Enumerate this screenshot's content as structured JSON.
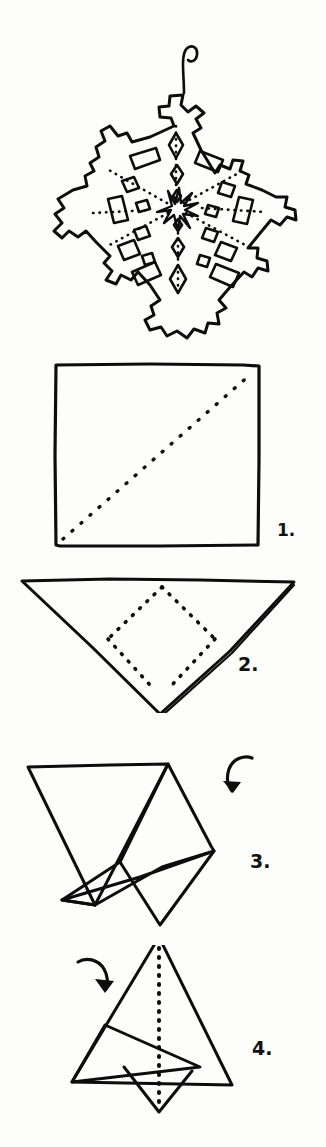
{
  "document": {
    "title": "Paper Snowflake Folding Instructions",
    "type": "hand-drawn instructional diagram",
    "background_color": "#fdfdfc",
    "ink_color": "#0d0d0d"
  },
  "result_figure": {
    "name": "finished-snowflake",
    "description": "Six-pointed hand-cut paper snowflake with hanging loop at top, cross-shaped arm tips, and cut-out diamond and rectangle holes; dotted radial fold lines converge on a small six-pointed star at the center.",
    "points": 6,
    "has_hanging_loop": true,
    "center_motif": "six-pointed star"
  },
  "steps": [
    {
      "number": "1.",
      "name": "fold-square-diagonally",
      "shape": "square",
      "fold_line": "diagonal dotted line from bottom-left corner to top-right corner"
    },
    {
      "number": "2.",
      "name": "fold-triangle-thirds",
      "shape": "downward triangle",
      "fold_line": "two dotted lines forming a V from the top edge to the bottom point"
    },
    {
      "number": "3.",
      "name": "fold-left-flap-over",
      "shape": "overlapping folded triangles",
      "arrow": "curved arrow pointing down-left"
    },
    {
      "number": "4.",
      "name": "fold-right-flap-over",
      "shape": "tall triangle with overlapping flaps",
      "fold_line": "vertical dotted center line",
      "arrow": "curved arrow pointing down-right"
    }
  ],
  "labels": {
    "step1": "1.",
    "step2": "2.",
    "step3": "3.",
    "step4": "4."
  }
}
